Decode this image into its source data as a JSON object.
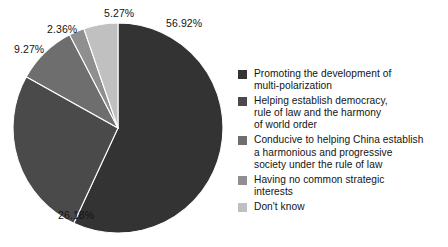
{
  "chart_data": {
    "type": "pie",
    "title": "",
    "subtitle": "",
    "xlabel": "",
    "ylabel": "",
    "grid": false,
    "legend_position": "right",
    "units": "percent",
    "start_angle_deg": 0,
    "direction": "clockwise",
    "categories": [
      "Promoting the development of multi-polarization",
      "Helping establish democracy, rule of law and the harmony of world order",
      "Conducive to helping China establish a harmonious and progressive society under the rule of law",
      "Having no common strategic interests",
      "Don't know"
    ],
    "values": [
      56.92,
      26.18,
      9.27,
      2.36,
      5.27
    ],
    "value_labels": [
      "56.92%",
      "26.18%",
      "9.27%",
      "2.36%",
      "5.27%"
    ],
    "colors": [
      "#333333",
      "#4a4a4a",
      "#6e6e6e",
      "#8f8f8f",
      "#c0c0c0"
    ],
    "slices": [
      {
        "label": "56.92%",
        "value": 56.92,
        "color": "#333333"
      },
      {
        "label": "26.18%",
        "value": 26.18,
        "color": "#4a4a4a"
      },
      {
        "label": "9.27%",
        "value": 9.27,
        "color": "#6e6e6e"
      },
      {
        "label": "2.36%",
        "value": 2.36,
        "color": "#8f8f8f"
      },
      {
        "label": "5.27%",
        "value": 5.27,
        "color": "#c0c0c0"
      }
    ]
  },
  "legend": {
    "items": [
      {
        "line1": "Promoting the development of",
        "line2": "multi-polarization",
        "line3": "",
        "color": "#333333"
      },
      {
        "line1": "Helping establish democracy,",
        "line2": "rule of law and the harmony",
        "line3": "of world order",
        "color": "#4a4a4a"
      },
      {
        "line1": "Conducive to helping China establish",
        "line2": "a harmonious and progressive",
        "line3": "society under the rule of law",
        "color": "#6e6e6e"
      },
      {
        "line1": "Having no common strategic",
        "line2": "interests",
        "line3": "",
        "color": "#8f8f8f"
      },
      {
        "line1": "Don't know",
        "line2": "",
        "line3": "",
        "color": "#c0c0c0"
      }
    ]
  }
}
